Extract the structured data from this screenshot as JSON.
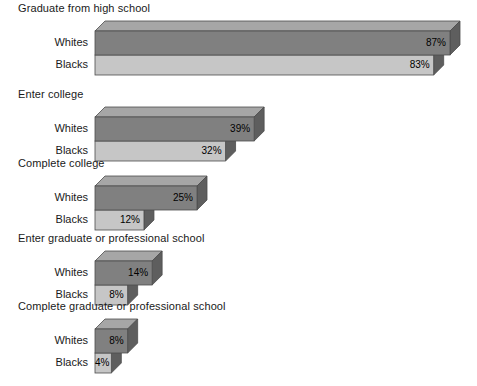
{
  "chart_data": {
    "type": "bar",
    "orientation": "horizontal",
    "style": "3d-stacked-pairs",
    "title": "",
    "xlabel": "",
    "ylabel": "",
    "unit": "%",
    "xlim": [
      0,
      87
    ],
    "grid": false,
    "legend": "none",
    "categories": [
      "Graduate from high school",
      "Enter college",
      "Complete college",
      "Enter graduate or professional school",
      "Complete graduate or professional school"
    ],
    "series": [
      {
        "name": "Whites",
        "values": [
          87,
          39,
          25,
          14,
          8
        ]
      },
      {
        "name": "Blacks",
        "values": [
          83,
          32,
          12,
          8,
          4
        ]
      }
    ],
    "groups": [
      {
        "title": "Graduate from high school",
        "rows": [
          {
            "label": "Whites",
            "value": 87,
            "value_label": "87%"
          },
          {
            "label": "Blacks",
            "value": 83,
            "value_label": "83%"
          }
        ]
      },
      {
        "title": "Enter college",
        "rows": [
          {
            "label": "Whites",
            "value": 39,
            "value_label": "39%"
          },
          {
            "label": "Blacks",
            "value": 32,
            "value_label": "32%"
          }
        ]
      },
      {
        "title": "Complete college",
        "rows": [
          {
            "label": "Whites",
            "value": 25,
            "value_label": "25%"
          },
          {
            "label": "Blacks",
            "value": 12,
            "value_label": "12%"
          }
        ]
      },
      {
        "title": "Enter graduate or professional school",
        "rows": [
          {
            "label": "Whites",
            "value": 14,
            "value_label": "14%"
          },
          {
            "label": "Blacks",
            "value": 8,
            "value_label": "8%"
          }
        ]
      },
      {
        "title": "Complete graduate or professional school",
        "rows": [
          {
            "label": "Whites",
            "value": 8,
            "value_label": "8%"
          },
          {
            "label": "Blacks",
            "value": 4,
            "value_label": "4%"
          }
        ]
      }
    ],
    "colors": {
      "background": "#ffffff",
      "whites_front": "#808080",
      "blacks_front": "#c6c6c6",
      "top_face": "#a6a6a6",
      "side_face_dark": "#5e5e5e",
      "side_face_light": "#767676",
      "edge": "#4d4d4d",
      "text": "#1a1a1a"
    }
  }
}
